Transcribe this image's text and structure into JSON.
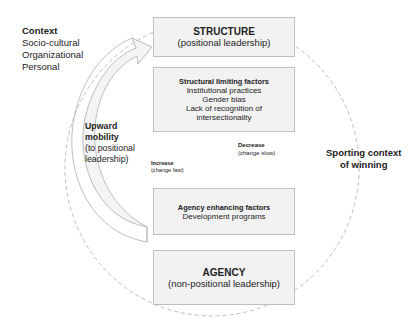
{
  "context": {
    "title": "Context",
    "items": [
      "Socio-cultural",
      "Organizational",
      "Personal"
    ]
  },
  "structure_box": {
    "title": "STRUCTURE",
    "subtitle": "(positional leadership)"
  },
  "structural_limiting_box": {
    "title": "Structural limiting factors",
    "items": [
      "Institutional practices",
      "Gender bias",
      "Lack of recognition of",
      "intersectionality"
    ]
  },
  "agency_enhancing_box": {
    "title": "Agency enhancing factors",
    "items": [
      "Development programs"
    ]
  },
  "agency_box": {
    "title": "AGENCY",
    "subtitle": "(non-positional leadership)"
  },
  "upward_mobility": {
    "title_line1": "Upward",
    "title_line2": "mobility",
    "sub_line1": "(to positional",
    "sub_line2": "leadership)"
  },
  "increase": {
    "title": "Increase",
    "sub": "(change fast)"
  },
  "decrease": {
    "title": "Decrease",
    "sub": "(change slow)"
  },
  "sporting_context": {
    "line1": "Sporting context",
    "line2": "of winning"
  },
  "colors": {
    "box_fill": "#f2f2f2",
    "box_border": "#bfbfbf",
    "dashed_circle": "#bfbfbf",
    "arrow_fill": "#f4f4f4",
    "arrow_stroke": "#b8b8b8"
  }
}
